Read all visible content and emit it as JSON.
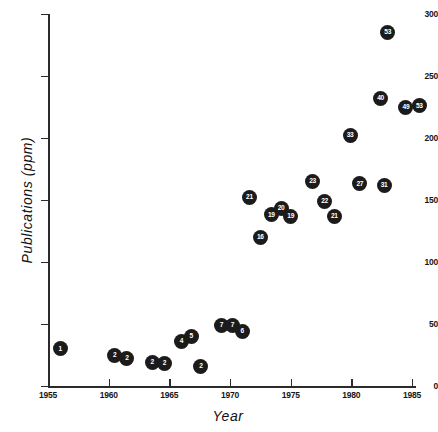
{
  "chart_data": {
    "type": "scatter",
    "title": "",
    "xlabel": "Year",
    "ylabel": "Publications  (ppm)",
    "xlim": [
      1955,
      1986.5
    ],
    "ylim": [
      0,
      300
    ],
    "xticks": [
      1955,
      1960,
      1965,
      1970,
      1975,
      1980,
      1985
    ],
    "ytickvalues": [
      0,
      50,
      100,
      150,
      200,
      250,
      300
    ],
    "grid": false,
    "legend": null,
    "point_label_note": "each marker is labelled with its publication count",
    "points": [
      {
        "label": "1",
        "x": 1956.0,
        "y": 30
      },
      {
        "label": "2",
        "x": 1960.5,
        "y": 25
      },
      {
        "label": "2",
        "x": 1961.5,
        "y": 22
      },
      {
        "label": "2",
        "x": 1963.6,
        "y": 19
      },
      {
        "label": "2",
        "x": 1964.6,
        "y": 18
      },
      {
        "label": "4",
        "x": 1966.0,
        "y": 36
      },
      {
        "label": "5",
        "x": 1966.8,
        "y": 40
      },
      {
        "label": "2",
        "x": 1967.6,
        "y": 16
      },
      {
        "label": "7",
        "x": 1969.3,
        "y": 49
      },
      {
        "label": "7",
        "x": 1970.2,
        "y": 49
      },
      {
        "label": "6",
        "x": 1971.0,
        "y": 44
      },
      {
        "label": "21",
        "x": 1971.6,
        "y": 152
      },
      {
        "label": "16",
        "x": 1972.5,
        "y": 120
      },
      {
        "label": "19",
        "x": 1973.4,
        "y": 138
      },
      {
        "label": "20",
        "x": 1974.2,
        "y": 143
      },
      {
        "label": "19",
        "x": 1975.0,
        "y": 137
      },
      {
        "label": "23",
        "x": 1976.8,
        "y": 165
      },
      {
        "label": "22",
        "x": 1977.8,
        "y": 149
      },
      {
        "label": "21",
        "x": 1978.6,
        "y": 137
      },
      {
        "label": "33",
        "x": 1979.9,
        "y": 202
      },
      {
        "label": "27",
        "x": 1980.7,
        "y": 163
      },
      {
        "label": "31",
        "x": 1982.7,
        "y": 162
      },
      {
        "label": "40",
        "x": 1982.4,
        "y": 232
      },
      {
        "label": "53",
        "x": 1983.0,
        "y": 285
      },
      {
        "label": "49",
        "x": 1984.5,
        "y": 225
      },
      {
        "label": "53",
        "x": 1985.6,
        "y": 226
      }
    ]
  },
  "axes": {
    "x_tick_labels": [
      "1955",
      "1960",
      "1965",
      "1970",
      "1975",
      "1980",
      "1985"
    ],
    "y_tick_labels": [
      "0",
      "50",
      "100",
      "150",
      "200",
      "250",
      "300"
    ],
    "x_title": "Year",
    "y_title": "Publications  (ppm)"
  }
}
